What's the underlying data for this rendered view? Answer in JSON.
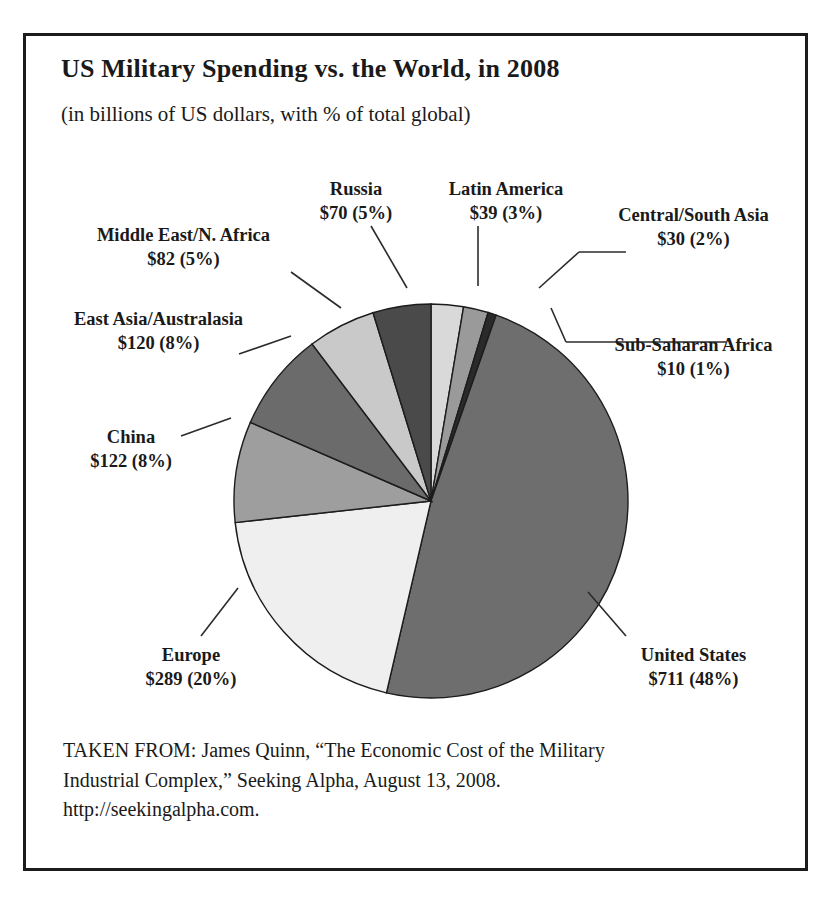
{
  "figure": {
    "title": "US Military Spending vs. the World, in 2008",
    "subtitle": "(in billions of US dollars, with % of total global)"
  },
  "caption": {
    "line1": "TAKEN FROM: James Quinn, “The Economic Cost of the Military",
    "line2": "Industrial Complex,” Seeking Alpha, August 13, 2008.",
    "line3": "http://seekingalpha.com."
  },
  "labels": {
    "russia": {
      "name": "Russia",
      "value": "$70 (5%)"
    },
    "latin": {
      "name": "Latin America",
      "value": "$39 (3%)"
    },
    "csasia": {
      "name": "Central/South Asia",
      "value": "$30 (2%)"
    },
    "mena": {
      "name": "Middle East/N. Africa",
      "value": "$82 (5%)"
    },
    "eastasia": {
      "name": "East Asia/Australasia",
      "value": "$120 (8%)"
    },
    "china": {
      "name": "China",
      "value": "$122 (8%)"
    },
    "europe": {
      "name": "Europe",
      "value": "$289 (20%)"
    },
    "ssa": {
      "name": "Sub-Saharan Africa",
      "value": "$10 (1%)"
    },
    "us": {
      "name": "United States",
      "value": "$711 (48%)"
    }
  },
  "chart_data": {
    "type": "pie",
    "title": "US Military Spending vs. the World, in 2008",
    "subtitle": "(in billions of US dollars, with % of total global)",
    "unit": "billions of US dollars",
    "start_angle_deg": 0,
    "direction": "clockwise",
    "legend": "callout-labels",
    "grid": false,
    "categories": [
      "Latin America",
      "Central/South Asia",
      "Sub-Saharan Africa",
      "United States",
      "Europe",
      "China",
      "East Asia/Australasia",
      "Middle East/N. Africa",
      "Russia"
    ],
    "values": [
      39,
      30,
      10,
      711,
      289,
      122,
      120,
      82,
      70
    ],
    "percents": [
      3,
      2,
      1,
      48,
      20,
      8,
      8,
      5,
      5
    ],
    "colors": [
      "#d9d9d9",
      "#9a9a9a",
      "#2a2a2a",
      "#6e6e6e",
      "#efefef",
      "#9e9e9e",
      "#6b6b6b",
      "#c9c9c9",
      "#4a4a4a"
    ],
    "slices": [
      {
        "label": "Latin America",
        "value": 39,
        "percent": 3,
        "color": "#d9d9d9"
      },
      {
        "label": "Central/South Asia",
        "value": 30,
        "percent": 2,
        "color": "#9a9a9a"
      },
      {
        "label": "Sub-Saharan Africa",
        "value": 10,
        "percent": 1,
        "color": "#2a2a2a"
      },
      {
        "label": "United States",
        "value": 711,
        "percent": 48,
        "color": "#6e6e6e"
      },
      {
        "label": "Europe",
        "value": 289,
        "percent": 20,
        "color": "#efefef"
      },
      {
        "label": "China",
        "value": 122,
        "percent": 8,
        "color": "#9e9e9e"
      },
      {
        "label": "East Asia/Australasia",
        "value": 120,
        "percent": 8,
        "color": "#6b6b6b"
      },
      {
        "label": "Middle East/N. Africa",
        "value": 82,
        "percent": 5,
        "color": "#c9c9c9"
      },
      {
        "label": "Russia",
        "value": 70,
        "percent": 5,
        "color": "#4a4a4a"
      }
    ]
  }
}
